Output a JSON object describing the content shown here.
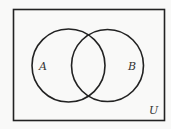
{
  "diagram": {
    "type": "venn",
    "universe_label": "U",
    "sets": [
      {
        "label": "A"
      },
      {
        "label": "B"
      }
    ],
    "colors": {
      "stroke": "#222222",
      "background": "#f9f9f8"
    }
  }
}
